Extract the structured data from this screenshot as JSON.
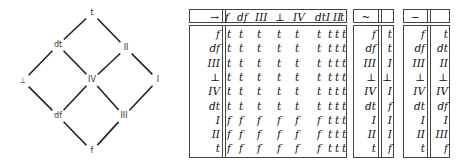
{
  "lattice": {
    "nodes": [
      {
        "id": "t",
        "label": "t",
        "x": 92,
        "y": 13
      },
      {
        "id": "dt",
        "label": "dt",
        "x": 58,
        "y": 45
      },
      {
        "id": "II",
        "label": "II",
        "x": 126,
        "y": 48
      },
      {
        "id": "bot",
        "label": "⊥",
        "x": 23,
        "y": 81
      },
      {
        "id": "IV",
        "label": "IV",
        "x": 92,
        "y": 80
      },
      {
        "id": "I",
        "label": "I",
        "x": 158,
        "y": 80
      },
      {
        "id": "df",
        "label": "df",
        "x": 58,
        "y": 116
      },
      {
        "id": "III",
        "label": "III",
        "x": 124,
        "y": 116
      },
      {
        "id": "f",
        "label": "f",
        "x": 92,
        "y": 151
      }
    ],
    "edges": [
      [
        "t",
        "dt"
      ],
      [
        "t",
        "II"
      ],
      [
        "dt",
        "bot"
      ],
      [
        "dt",
        "IV"
      ],
      [
        "II",
        "IV"
      ],
      [
        "II",
        "I"
      ],
      [
        "bot",
        "df"
      ],
      [
        "IV",
        "df"
      ],
      [
        "IV",
        "III"
      ],
      [
        "I",
        "III"
      ],
      [
        "df",
        "f"
      ],
      [
        "III",
        "f"
      ]
    ]
  },
  "implication_table": {
    "operator": "→",
    "columns": [
      "f",
      "df",
      "III",
      "⊥",
      "IV",
      "dt",
      "I",
      "II",
      "t"
    ],
    "rows": [
      {
        "label": "f",
        "values": [
          "t",
          "t",
          "t",
          "t",
          "t",
          "t",
          "t",
          "t",
          "t"
        ]
      },
      {
        "label": "df",
        "values": [
          "t",
          "t",
          "t",
          "t",
          "t",
          "t",
          "t",
          "t",
          "t"
        ]
      },
      {
        "label": "III",
        "values": [
          "t",
          "t",
          "t",
          "t",
          "t",
          "t",
          "t",
          "t",
          "t"
        ]
      },
      {
        "label": "⊥",
        "values": [
          "t",
          "t",
          "t",
          "t",
          "t",
          "t",
          "t",
          "t",
          "t"
        ]
      },
      {
        "label": "IV",
        "values": [
          "t",
          "t",
          "t",
          "t",
          "t",
          "t",
          "t",
          "t",
          "t"
        ]
      },
      {
        "label": "dt",
        "values": [
          "t",
          "t",
          "t",
          "t",
          "t",
          "t",
          "t",
          "t",
          "t"
        ]
      },
      {
        "label": "I",
        "values": [
          "f",
          "f",
          "f",
          "f",
          "f",
          "f",
          "t",
          "t",
          "t"
        ]
      },
      {
        "label": "II",
        "values": [
          "f",
          "f",
          "f",
          "f",
          "f",
          "f",
          "t",
          "t",
          "t"
        ]
      },
      {
        "label": "t",
        "values": [
          "f",
          "f",
          "f",
          "f",
          "f",
          "f",
          "t",
          "t",
          "t"
        ]
      }
    ]
  },
  "negation_table": {
    "operator": "~",
    "rows": [
      {
        "label": "f",
        "value": "t"
      },
      {
        "label": "df",
        "value": "t"
      },
      {
        "label": "III",
        "value": "I"
      },
      {
        "label": "⊥",
        "value": "⊥"
      },
      {
        "label": "IV",
        "value": "I"
      },
      {
        "label": "dt",
        "value": "f"
      },
      {
        "label": "I",
        "value": "I"
      },
      {
        "label": "II",
        "value": "I"
      },
      {
        "label": "t",
        "value": "f"
      }
    ]
  },
  "complement_table": {
    "operator": "−",
    "rows": [
      {
        "label": "f",
        "value": "t"
      },
      {
        "label": "df",
        "value": "dt"
      },
      {
        "label": "III",
        "value": "II"
      },
      {
        "label": "⊥",
        "value": "⊥"
      },
      {
        "label": "IV",
        "value": "IV"
      },
      {
        "label": "dt",
        "value": "df"
      },
      {
        "label": "I",
        "value": "I"
      },
      {
        "label": "II",
        "value": "III"
      },
      {
        "label": "t",
        "value": "f"
      }
    ]
  }
}
